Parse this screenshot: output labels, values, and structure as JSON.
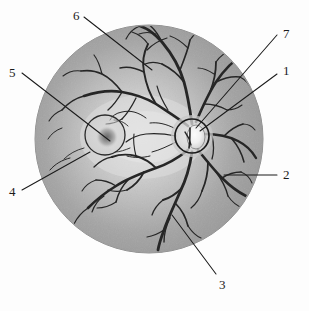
{
  "figure": {
    "kind": "anatomical-line-diagram",
    "canvas": {
      "width": 309,
      "height": 311
    },
    "background_color": "#fdfdfd"
  },
  "fundus": {
    "name": "fundus-circle",
    "center": {
      "x": 149,
      "y": 139
    },
    "radius": 114,
    "fill_outer_color": "#9a9a9a",
    "fill_inner_color": "#d8d8d8",
    "outline_color": "#8d8d8d"
  },
  "optic_disc": {
    "name": "optic-disc",
    "center": {
      "x": 192,
      "y": 136
    },
    "radius": 17,
    "outline_color": "#1b1b1b",
    "cup_color": "#f2f2f2"
  },
  "macula": {
    "name": "macula",
    "center": {
      "x": 105,
      "y": 135
    },
    "radius": 20,
    "outline_color": "#2a2a2a",
    "fovea_color": "#6f6f6f"
  },
  "vessels": {
    "name": "retinal-vessels",
    "stroke_color": "#262626"
  },
  "labels": [
    {
      "id": "1",
      "text": "1",
      "name": "label-1-optic-disc",
      "text_pos": {
        "x": 283,
        "y": 64
      },
      "line": {
        "x1": 277,
        "y1": 74,
        "x2": 200,
        "y2": 131
      }
    },
    {
      "id": "2",
      "text": "2",
      "name": "label-2-retina",
      "text_pos": {
        "x": 283,
        "y": 168
      },
      "line": {
        "x1": 277,
        "y1": 175,
        "x2": 224,
        "y2": 175
      }
    },
    {
      "id": "3",
      "text": "3",
      "name": "label-3-inferior-vessel-branch",
      "text_pos": {
        "x": 219,
        "y": 278
      },
      "line": {
        "x1": 216,
        "y1": 274,
        "x2": 172,
        "y2": 215
      }
    },
    {
      "id": "4",
      "text": "4",
      "name": "label-4-macula-margin",
      "text_pos": {
        "x": 9,
        "y": 185
      },
      "line": {
        "x1": 22,
        "y1": 190,
        "x2": 90,
        "y2": 152
      }
    },
    {
      "id": "5",
      "text": "5",
      "name": "label-5-fovea-centralis",
      "text_pos": {
        "x": 9,
        "y": 66
      },
      "line": {
        "x1": 22,
        "y1": 73,
        "x2": 110,
        "y2": 141
      }
    },
    {
      "id": "6",
      "text": "6",
      "name": "label-6-superior-vessel-branch",
      "text_pos": {
        "x": 73,
        "y": 9
      },
      "line": {
        "x1": 84,
        "y1": 17,
        "x2": 152,
        "y2": 70
      }
    },
    {
      "id": "7",
      "text": "7",
      "name": "label-7-central-vessels",
      "text_pos": {
        "x": 283,
        "y": 27
      },
      "line": {
        "x1": 277,
        "y1": 35,
        "x2": 196,
        "y2": 128
      }
    }
  ]
}
